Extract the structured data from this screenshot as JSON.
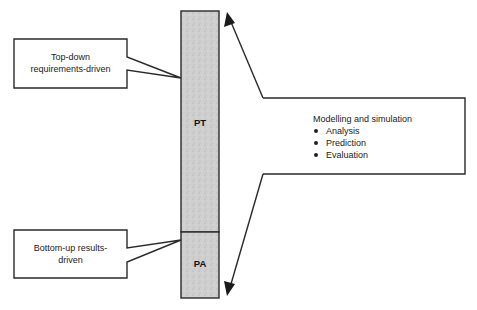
{
  "diagram": {
    "bar": {
      "segments": [
        {
          "id": "pt",
          "label": "PT"
        },
        {
          "id": "pa",
          "label": "PA"
        }
      ],
      "fill_color": "#c9c9c9",
      "stroke_color": "#2a2a2a"
    },
    "callouts": {
      "top_left": {
        "lines": [
          "Top-down",
          "requirements-driven"
        ]
      },
      "bottom_left": {
        "lines": [
          "Bottom-up results-",
          "driven"
        ]
      },
      "right": {
        "title": "Modelling and simulation",
        "items": [
          "Analysis",
          "Prediction",
          "Evaluation"
        ]
      }
    },
    "arrows": [
      {
        "id": "arrow-up",
        "direction": "up"
      },
      {
        "id": "arrow-down",
        "direction": "down"
      }
    ]
  }
}
